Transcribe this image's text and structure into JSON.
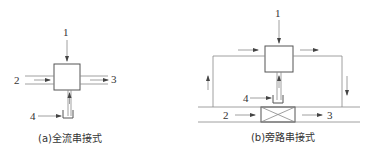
{
  "diagram_a": {
    "caption": "(a)全流串接式",
    "labels": {
      "n1": "1",
      "n2": "2",
      "n3": "3",
      "n4": "4"
    }
  },
  "diagram_b": {
    "caption": "(b)旁路串接式",
    "labels": {
      "n1": "1",
      "n2": "2",
      "n3": "3",
      "n4": "4"
    }
  },
  "colors": {
    "line": "#555555",
    "text": "#333333",
    "background": "#ffffff"
  }
}
